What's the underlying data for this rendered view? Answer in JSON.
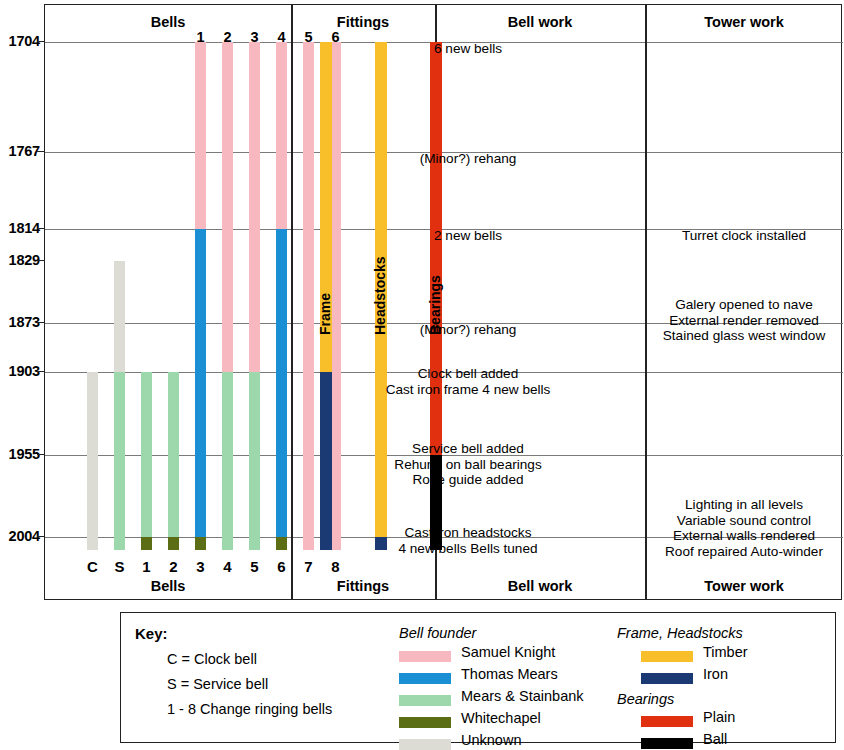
{
  "chart_data": {
    "type": "table",
    "ylabel": "Year",
    "years": [
      1704,
      1767,
      1814,
      1829,
      1873,
      1903,
      1955,
      2004
    ],
    "ylim": [
      1704,
      2004
    ],
    "grid": true,
    "legend_position": "bottom",
    "panels": [
      {
        "name": "Bells",
        "header": "Bells",
        "footer": "Bells"
      },
      {
        "name": "Fittings",
        "header": "Fittings",
        "footer": "Fittings"
      },
      {
        "name": "Bell work",
        "header": "Bell work",
        "footer": "Bell work"
      },
      {
        "name": "Tower work",
        "header": "Tower work",
        "footer": "Tower work"
      }
    ],
    "bell_columns": [
      {
        "label": "C",
        "top_label": "",
        "segments": [
          {
            "from": 1903,
            "to": 2004,
            "founder": "Unknown"
          }
        ]
      },
      {
        "label": "S",
        "top_label": "",
        "segments": [
          {
            "from": 1829,
            "to": 1903,
            "founder": "Unknown"
          },
          {
            "from": 1903,
            "to": 2004,
            "founder": "Mears & Stainbank"
          }
        ]
      },
      {
        "label": "1",
        "top_label": "",
        "segments": [
          {
            "from": 1903,
            "to": 2004,
            "founder": "Mears & Stainbank"
          },
          {
            "from": 2004,
            "to": 2004,
            "founder": "Whitechapel"
          }
        ]
      },
      {
        "label": "2",
        "top_label": "",
        "segments": [
          {
            "from": 1903,
            "to": 2004,
            "founder": "Mears & Stainbank"
          },
          {
            "from": 2004,
            "to": 2004,
            "founder": "Whitechapel"
          }
        ]
      },
      {
        "label": "3",
        "top_label": "1",
        "segments": [
          {
            "from": 1704,
            "to": 1814,
            "founder": "Samuel Knight"
          },
          {
            "from": 1814,
            "to": 2004,
            "founder": "Thomas Mears"
          },
          {
            "from": 2004,
            "to": 2004,
            "founder": "Whitechapel"
          }
        ]
      },
      {
        "label": "4",
        "top_label": "2",
        "segments": [
          {
            "from": 1704,
            "to": 1903,
            "founder": "Samuel Knight"
          },
          {
            "from": 1903,
            "to": 2004,
            "founder": "Mears & Stainbank"
          }
        ]
      },
      {
        "label": "5",
        "top_label": "3",
        "segments": [
          {
            "from": 1704,
            "to": 1903,
            "founder": "Samuel Knight"
          },
          {
            "from": 1903,
            "to": 2004,
            "founder": "Mears & Stainbank"
          }
        ]
      },
      {
        "label": "6",
        "top_label": "4",
        "segments": [
          {
            "from": 1704,
            "to": 1814,
            "founder": "Samuel Knight"
          },
          {
            "from": 1814,
            "to": 2004,
            "founder": "Thomas Mears"
          },
          {
            "from": 2004,
            "to": 2004,
            "founder": "Whitechapel"
          }
        ]
      },
      {
        "label": "7",
        "top_label": "5",
        "segments": [
          {
            "from": 1704,
            "to": 2004,
            "founder": "Samuel Knight"
          }
        ]
      },
      {
        "label": "8",
        "top_label": "6",
        "segments": [
          {
            "from": 1704,
            "to": 2004,
            "founder": "Samuel Knight"
          }
        ]
      }
    ],
    "fitting_columns": [
      {
        "label": "Frame",
        "segments": [
          {
            "from": 1704,
            "to": 1903,
            "material": "Timber"
          },
          {
            "from": 1903,
            "to": 2004,
            "material": "Iron"
          }
        ]
      },
      {
        "label": "Headstocks",
        "segments": [
          {
            "from": 1704,
            "to": 2004,
            "material": "Timber"
          },
          {
            "from": 2004,
            "to": 2004,
            "material": "Iron"
          }
        ]
      },
      {
        "label": "Bearings",
        "segments": [
          {
            "from": 1704,
            "to": 1955,
            "material": "Plain"
          },
          {
            "from": 1955,
            "to": 2004,
            "material": "Ball"
          }
        ]
      }
    ],
    "bell_work": [
      {
        "year": 1704,
        "lines": [
          "6 new bells"
        ]
      },
      {
        "year": 1767,
        "lines": [
          "(Minor?) rehang"
        ]
      },
      {
        "year": 1814,
        "lines": [
          "2 new bells"
        ]
      },
      {
        "year": 1873,
        "lines": [
          "(Minor?) rehang"
        ]
      },
      {
        "year": 1903,
        "lines": [
          "Clock bell added",
          "Cast iron frame  4 new bells"
        ]
      },
      {
        "year": 1955,
        "lines": [
          "Service bell added",
          "Rehung on ball bearings",
          "Rope guide added"
        ]
      },
      {
        "year": 2004,
        "lines": [
          "Cast iron headstocks",
          "4 new bells   Bells tuned"
        ]
      }
    ],
    "tower_work": [
      {
        "year": 1814,
        "lines": [
          "Turret clock installed"
        ]
      },
      {
        "year": 1873,
        "lines": [
          "Galery opened to nave",
          "External render removed",
          "Stained glass west window"
        ]
      },
      {
        "year": 2004,
        "lines": [
          "Lighting in all levels",
          "Variable sound control",
          "External walls rendered",
          "Roof repaired   Auto-winder"
        ]
      }
    ]
  },
  "legend": {
    "key_title": "Key:",
    "notes": [
      "C = Clock bell",
      "S = Service bell",
      "1 - 8 Change ringing bells"
    ],
    "founder_heading": "Bell founder",
    "founders": [
      {
        "label": "Samuel Knight",
        "color": "#f7b8c0"
      },
      {
        "label": "Thomas Mears",
        "color": "#1b8fd4"
      },
      {
        "label": "Mears & Stainbank",
        "color": "#9dd8ac"
      },
      {
        "label": "Whitechapel",
        "color": "#4f6川"
      },
      {
        "label": "Unknown",
        "color": "#dcdcd4"
      }
    ],
    "frame_heading": "Frame, Headstocks",
    "frame_materials": [
      {
        "label": "Timber",
        "color": "#f9bf2b"
      },
      {
        "label": "Iron",
        "color": "#1b3a73"
      }
    ],
    "bearings_heading": "Bearings",
    "bearings_materials": [
      {
        "label": "Plain",
        "color": "#e03010"
      },
      {
        "label": "Ball",
        "color": "#000000"
      }
    ]
  },
  "colors": {
    "samuel_knight": "#f7b8c0",
    "thomas_mears": "#1b8fd4",
    "mears_stainbank": "#9dd8ac",
    "whitechapel": "#5b6e15",
    "unknown": "#dcdcd4",
    "timber": "#f9bf2b",
    "iron": "#1b3a73",
    "plain": "#e03010",
    "ball": "#000000",
    "gridline": "#7a7a7a",
    "frame": "#222222"
  }
}
